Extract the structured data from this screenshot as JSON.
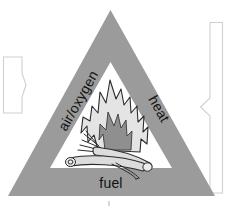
{
  "diagram": {
    "shape": "triangle",
    "outer_triangle_color": "#9b9b9b",
    "inner_triangle_color": "#ffffff",
    "labels": {
      "left": "air/oxygen",
      "right": "heat",
      "bottom": "fuel"
    },
    "center_illustration": "campfire",
    "illustration_parts": {
      "flame": "flame",
      "inner_flame": "inner-flame",
      "log_front": "log",
      "log_back": "log",
      "kindling": "twigs"
    },
    "callouts": {
      "left": {
        "name": "left-callout-bracket",
        "style": "bracket-arrow-pointing-right",
        "color": "#cfcfcf",
        "text": ""
      },
      "right": {
        "name": "right-callout-bracket",
        "style": "bracket-arrow-pointing-left",
        "color": "#cfcfcf",
        "text": ""
      }
    }
  }
}
